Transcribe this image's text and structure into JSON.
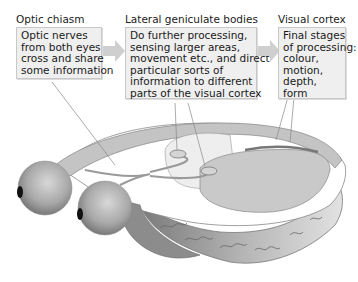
{
  "diagram": {
    "stages": [
      {
        "title": "Optic chiasm",
        "lines": [
          "Optic nerves",
          "from both eyes",
          "cross and share",
          "some information"
        ]
      },
      {
        "title": "Lateral geniculate bodies",
        "lines": [
          "Do further processing,",
          "sensing larger areas,",
          "movement etc., and direct",
          "particular sorts of",
          "information to different",
          "parts of the visual cortex"
        ]
      },
      {
        "title": "Visual cortex",
        "lines": [
          "Final stages",
          "of processing:",
          "colour,",
          "motion,",
          "depth,",
          "form"
        ]
      }
    ],
    "arrows": [
      "arrow-right",
      "arrow-right"
    ],
    "illustration": {
      "parts": [
        "left-eyeball",
        "right-eyeball",
        "optic-nerves",
        "optic-chiasm",
        "lateral-geniculate-bodies",
        "visual-cortex",
        "brain-cross-section"
      ]
    },
    "colors": {
      "box_fill": "#efefef",
      "box_border": "#c8c8c8",
      "arrow_fill": "#cfcfcf",
      "brain_light": "#e4e4e4",
      "brain_mid": "#bdbdbd",
      "brain_dark": "#8a8a8a"
    }
  }
}
